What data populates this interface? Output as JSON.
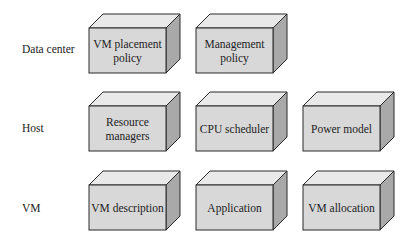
{
  "diagram": {
    "rows": [
      {
        "label": "Data center",
        "boxes": [
          {
            "label": "VM placement policy"
          },
          {
            "label": "Management policy"
          }
        ]
      },
      {
        "label": "Host",
        "boxes": [
          {
            "label": "Resource managers"
          },
          {
            "label": "CPU scheduler"
          },
          {
            "label": "Power model"
          }
        ]
      },
      {
        "label": "VM",
        "boxes": [
          {
            "label": "VM description"
          },
          {
            "label": "Application"
          },
          {
            "label": "VM allocation"
          }
        ]
      }
    ],
    "colors": {
      "front_face": "#d8d8d8",
      "top_face": "#e9e9e9",
      "side_face": "#a9a9a9",
      "stroke": "#2a2a2a"
    }
  }
}
